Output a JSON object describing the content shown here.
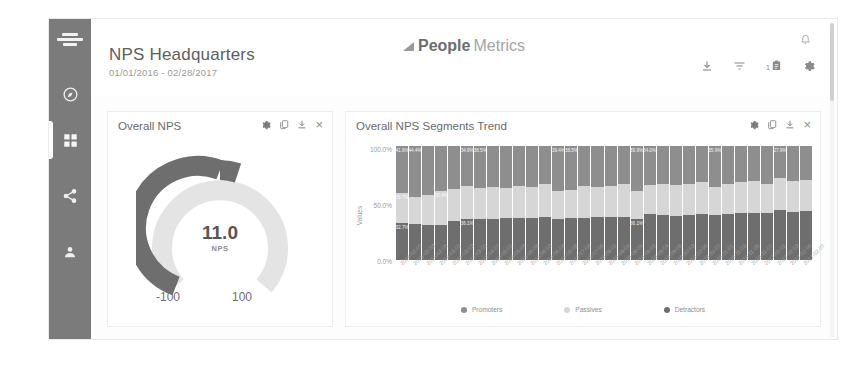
{
  "sidebar": {
    "logo_name": "peoplemetrics-mark",
    "items": [
      {
        "name": "sidebar-item-compass",
        "icon": "compass-icon",
        "active": false
      },
      {
        "name": "sidebar-item-dashboard",
        "icon": "grid-icon",
        "active": true
      },
      {
        "name": "sidebar-item-share",
        "icon": "share-icon",
        "active": false
      },
      {
        "name": "sidebar-item-user",
        "icon": "person-icon",
        "active": false
      }
    ]
  },
  "header": {
    "title": "NPS Headquarters",
    "subtitle": "01/01/2016 - 02/28/2017",
    "brand_bold": "People",
    "brand_light": "Metrics",
    "icons": [
      {
        "name": "download-icon",
        "label": "download"
      },
      {
        "name": "filter-icon",
        "label": "filter"
      },
      {
        "name": "clipboard-icon",
        "label": "notes",
        "badge": "1"
      },
      {
        "name": "gear-icon",
        "label": "settings"
      }
    ],
    "bell": "notification-bell-icon"
  },
  "card_tools": [
    {
      "name": "gear-icon",
      "label": "settings"
    },
    {
      "name": "copy-icon",
      "label": "duplicate"
    },
    {
      "name": "download-icon",
      "label": "download"
    },
    {
      "name": "close-icon",
      "label": "×"
    }
  ],
  "gauge_card": {
    "title": "Overall NPS",
    "value": "11.0",
    "unit": "NPS",
    "min_label": "-100",
    "max_label": "100"
  },
  "trend_card": {
    "title": "Overall NPS Segments Trend"
  },
  "colors": {
    "promoters": "#8e8e8e",
    "passives": "#d6d6d6",
    "detractors": "#6e6e6e",
    "gauge_fill": "#6e6e6e",
    "gauge_track": "#e4e4e4",
    "sidebar": "#7b7b7b"
  },
  "chart_data": {
    "type": "bar",
    "title": "Overall NPS Segments Trend",
    "xlabel": "",
    "ylabel": "Values",
    "ylim": [
      0,
      100
    ],
    "ytick_labels": [
      "100.0%",
      "50.0%",
      "0.0%"
    ],
    "grid": false,
    "stacked": true,
    "legend_position": "bottom",
    "legend": [
      "Promoters",
      "Passives",
      "Detractors"
    ],
    "categories": [
      "2016-02-01",
      "2016-02-03",
      "2016-02-05",
      "2016-03-01",
      "2016-03-03",
      "2016-03-05",
      "2016-04-07",
      "2016-05-02",
      "2016-05-04",
      "2016-05-06",
      "2016-06-02",
      "2016-06-04",
      "2016-06-06",
      "2016-07-04",
      "2016-07-06",
      "2016-08-02",
      "2016-08-04",
      "2016-08-06",
      "2016-09-02",
      "2016-09-04",
      "2016-09-06",
      "2016-10-03",
      "2016-10-05",
      "2016-10-07",
      "2016-11-01",
      "2016-11-03",
      "2016-11-05",
      "2016-11-07",
      "2017-02-01",
      "2017-02-03",
      "2017-02-05",
      "2017-02-07"
    ],
    "series": [
      {
        "name": "Promoters",
        "color": "#8e8e8e",
        "values": [
          41.6,
          44.4,
          43.0,
          39.2,
          38.0,
          34.9,
          36.5,
          36.2,
          37.0,
          34.9,
          36.2,
          33.0,
          39.4,
          38.5,
          35.0,
          36.0,
          34.8,
          33.4,
          39.9,
          34.0,
          33.5,
          34.2,
          33.0,
          32.0,
          35.9,
          33.6,
          32.0,
          31.0,
          33.0,
          27.9,
          31.0,
          29.5
        ]
      },
      {
        "name": "Passives",
        "color": "#d6d6d6",
        "values": [
          25.7,
          24.0,
          26.0,
          30.4,
          28.0,
          29.0,
          27.5,
          27.8,
          26.0,
          28.5,
          27.0,
          29.0,
          25.0,
          24.5,
          28.0,
          26.0,
          27.2,
          28.6,
          24.0,
          26.0,
          27.0,
          26.8,
          27.5,
          28.0,
          25.0,
          26.4,
          27.0,
          28.0,
          26.0,
          28.6,
          27.0,
          27.1
        ]
      },
      {
        "name": "Detractors",
        "color": "#6e6e6e",
        "values": [
          32.7,
          31.6,
          31.0,
          30.4,
          34.0,
          36.1,
          36.0,
          36.0,
          37.0,
          36.6,
          36.8,
          38.0,
          35.6,
          37.0,
          37.0,
          38.0,
          38.0,
          38.0,
          36.1,
          40.0,
          39.5,
          39.0,
          39.5,
          40.0,
          39.1,
          40.0,
          41.0,
          41.0,
          41.0,
          43.5,
          42.0,
          43.4
        ]
      }
    ],
    "data_labels": {
      "Promoters": [
        "41.6%",
        "44.4%",
        "",
        "",
        "",
        "34.9%",
        "36.5%",
        "",
        "",
        "",
        "",
        "",
        "39.4%",
        "38.5%",
        "",
        "",
        "",
        "",
        "39.9%",
        "34.0%",
        "",
        "",
        "",
        "",
        "35.9%",
        "",
        "",
        "",
        "",
        "27.9%",
        "",
        ""
      ],
      "Passives": [
        "25.7%",
        "",
        "",
        "30.4%",
        "",
        "",
        "",
        "",
        "",
        "",
        "",
        "",
        "",
        "",
        "",
        "",
        "",
        "",
        "",
        "",
        "",
        "",
        "",
        "",
        "",
        "",
        "",
        "",
        "",
        "",
        "",
        ""
      ],
      "Detractors": [
        "32.7%",
        "",
        "",
        "",
        "",
        "36.1%",
        "",
        "",
        "",
        "",
        "",
        "",
        "",
        "",
        "",
        "",
        "",
        "",
        "36.1%",
        "",
        "",
        "",
        "",
        "",
        "",
        "",
        "",
        "",
        "",
        "",
        "",
        ""
      ]
    }
  }
}
